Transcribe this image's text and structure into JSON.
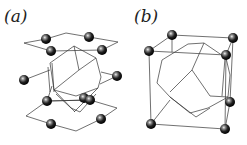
{
  "panels": [
    {
      "id": "a",
      "label": "(a)"
    },
    {
      "id": "b",
      "label": "(b)"
    }
  ],
  "colors": {
    "line": "#333333",
    "sphere_dark": "#111111",
    "sphere_highlight": "#e0e0e0",
    "background": "#ffffff"
  }
}
